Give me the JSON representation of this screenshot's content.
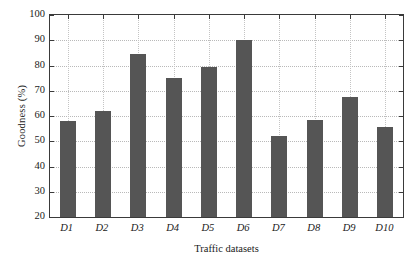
{
  "chart_data": {
    "type": "bar",
    "title": "",
    "xlabel": "Traffic datasets",
    "ylabel": "Goodness (%)",
    "categories": [
      "D1",
      "D2",
      "D3",
      "D4",
      "D5",
      "D6",
      "D7",
      "D8",
      "D9",
      "D10"
    ],
    "values": [
      58,
      62,
      84.5,
      75,
      79.5,
      90,
      52,
      58.5,
      67.5,
      55.5
    ],
    "ylim": [
      20,
      100
    ],
    "yticks": [
      20,
      30,
      40,
      50,
      60,
      70,
      80,
      90,
      100
    ],
    "ytick_labels": [
      "20",
      "30",
      "40",
      "50",
      "60",
      "70",
      "80",
      "90",
      "100"
    ],
    "grid": true,
    "legend": "none",
    "bar_color": "#555555",
    "axis_color": "#3a3a3a",
    "grid_color": "#b9b9b9",
    "background": "#ffffff"
  }
}
